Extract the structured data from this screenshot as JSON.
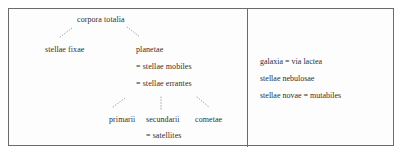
{
  "diagram": {
    "type": "taxonomic-tree",
    "title": "corpora totalia",
    "language": "Latin",
    "panels": [
      {
        "id": "left-panel",
        "name": "corpora-totalia-tree",
        "root": "corpora totalia",
        "nodes": [
          {
            "id": "corpora",
            "label": "corpora totalia",
            "level": 0
          },
          {
            "id": "fixae",
            "label": "stellae fixae",
            "level": 1
          },
          {
            "id": "planetae",
            "label": "planetae",
            "level": 1
          },
          {
            "id": "mobiles",
            "label": "= stellae mobiles",
            "level": 2
          },
          {
            "id": "errantes",
            "label": "= stellae errantes",
            "level": 2
          },
          {
            "id": "primarii",
            "label": "primarii",
            "level": 3
          },
          {
            "id": "secundarii",
            "label": "secundarii",
            "level": 3
          },
          {
            "id": "cometae",
            "label": "cometae",
            "level": 3
          },
          {
            "id": "satellites",
            "label": "= satellites",
            "level": 4
          }
        ],
        "edges": [
          {
            "from": "corpora",
            "to": "fixae",
            "style": "dotted-diagonal-left"
          },
          {
            "from": "corpora",
            "to": "planetae",
            "style": "dotted-diagonal-right"
          },
          {
            "from": "planetae",
            "to": "primarii",
            "style": "dotted-diagonal-left"
          },
          {
            "from": "planetae",
            "to": "secundarii",
            "style": "dotted-vertical"
          },
          {
            "from": "planetae",
            "to": "cometae",
            "style": "dotted-diagonal-right"
          }
        ]
      },
      {
        "id": "right-panel",
        "name": "nebulosae-list",
        "lines": [
          {
            "id": "galaxia",
            "label": "galaxia = via lactea"
          },
          {
            "id": "nebulosae",
            "label": "stellae nebulosae"
          },
          {
            "id": "novae",
            "label": "stellae novae = mutabiles"
          }
        ]
      }
    ]
  },
  "colors": {
    "border": "#6b6b6b",
    "text": "#2f2f2f",
    "connector": "#9a9a9a",
    "background": "#fdfdfd"
  }
}
